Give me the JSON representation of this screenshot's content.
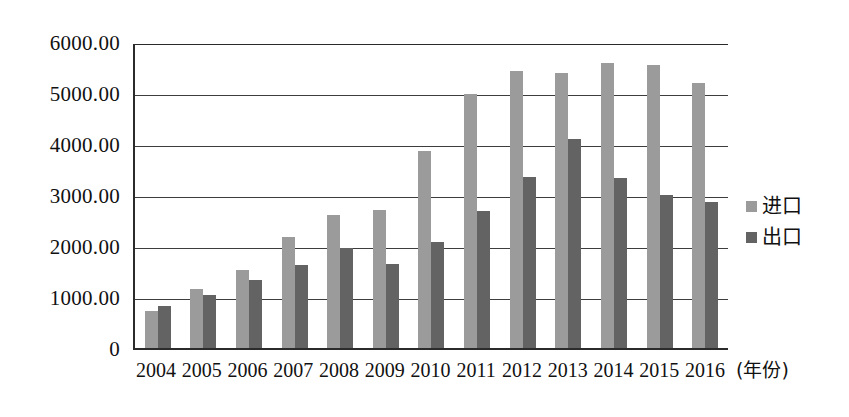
{
  "chart_data": {
    "type": "bar",
    "title": "",
    "xlabel": "(年份)",
    "ylabel": "",
    "ylim": [
      0,
      6000
    ],
    "ytick_labels": [
      "6000.00",
      "5000.00",
      "4000.00",
      "3000.00",
      "2000.00",
      "1000.00",
      "0"
    ],
    "yticks": [
      6000,
      5000,
      4000,
      3000,
      2000,
      1000,
      0
    ],
    "grid": true,
    "legend_position": "right",
    "categories": [
      "2004",
      "2005",
      "2006",
      "2007",
      "2008",
      "2009",
      "2010",
      "2011",
      "2012",
      "2013",
      "2014",
      "2015",
      "2016"
    ],
    "series": [
      {
        "name": "进口",
        "color": "#9b9b9b",
        "values": [
          725,
          1160,
          1520,
          2170,
          2610,
          2700,
          3870,
          4980,
          5430,
          5400,
          5580,
          5550,
          5200
        ]
      },
      {
        "name": "出口",
        "color": "#636363",
        "values": [
          825,
          1030,
          1330,
          1630,
          1970,
          1640,
          2070,
          2690,
          3350,
          4100,
          3330,
          3000,
          2870
        ]
      }
    ]
  }
}
